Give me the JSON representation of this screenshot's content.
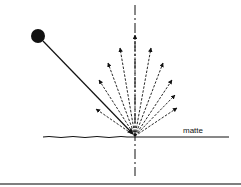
{
  "diagram": {
    "type": "diffuse-reflection",
    "surface_label": "matte",
    "colors": {
      "ink": "#111111",
      "background": "#ffffff",
      "border": "#555555"
    },
    "light_source": {
      "cx": 38,
      "cy": 36,
      "r": 7
    },
    "impact_point": {
      "x": 135,
      "y": 136
    },
    "incident_ray": {
      "x1": 43,
      "y1": 41,
      "x2": 133,
      "y2": 134
    },
    "normal_axis": {
      "x": 135,
      "y1": 5,
      "y2": 176
    },
    "surface": {
      "x1": 43,
      "x2": 229,
      "y": 137
    },
    "reflected_rays": [
      {
        "x": 96,
        "y": 109
      },
      {
        "x": 99,
        "y": 80
      },
      {
        "x": 108,
        "y": 63
      },
      {
        "x": 120,
        "y": 48
      },
      {
        "x": 135,
        "y": 35
      },
      {
        "x": 151,
        "y": 48
      },
      {
        "x": 163,
        "y": 63
      },
      {
        "x": 172,
        "y": 80
      },
      {
        "x": 175,
        "y": 95
      },
      {
        "x": 177,
        "y": 108
      }
    ],
    "bottom_rule_y": 184
  }
}
